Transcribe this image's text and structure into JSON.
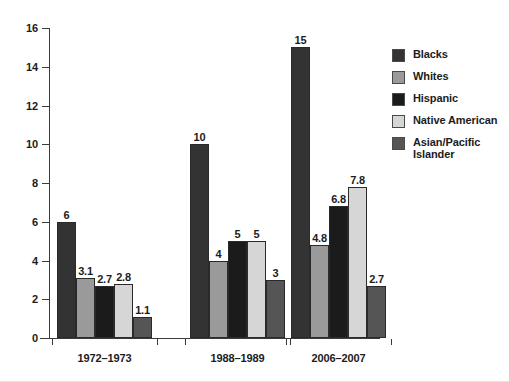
{
  "chart_data": {
    "type": "bar",
    "title": "",
    "xlabel": "",
    "ylabel": "",
    "ylim": [
      0,
      16
    ],
    "yticks": [
      0,
      2,
      4,
      6,
      8,
      10,
      12,
      14,
      16
    ],
    "ytick_labels": [
      "0",
      "2",
      "4",
      "6",
      "8",
      "10",
      "12",
      "14",
      "16"
    ],
    "grid": false,
    "legend_position": "right",
    "categories": [
      "1972–1973",
      "1988–1989",
      "2006–2007"
    ],
    "series": [
      {
        "name": "Blacks",
        "color": "#333333",
        "values": [
          6,
          10,
          15
        ],
        "labels": [
          "6",
          "10",
          "15"
        ]
      },
      {
        "name": "Whites",
        "color": "#9a9a9a",
        "values": [
          3.1,
          4,
          4.8
        ],
        "labels": [
          "3.1",
          "4",
          "4.8"
        ]
      },
      {
        "name": "Hispanic",
        "color": "#1b1b1b",
        "values": [
          2.7,
          5,
          6.8
        ],
        "labels": [
          "2.7",
          "5",
          "6.8"
        ]
      },
      {
        "name": "Native American",
        "color": "#d6d6d6",
        "values": [
          2.8,
          5,
          7.8
        ],
        "labels": [
          "2.8",
          "5",
          "7.8"
        ]
      },
      {
        "name": "Asian/Pacific Islander",
        "color": "#555555",
        "values": [
          1.1,
          3,
          2.7
        ],
        "labels": [
          "1.1",
          "3",
          "2.7"
        ]
      }
    ]
  },
  "legend": {
    "items": [
      {
        "label": "Blacks",
        "color": "#333333"
      },
      {
        "label": "Whites",
        "color": "#9a9a9a"
      },
      {
        "label": "Hispanic",
        "color": "#1b1b1b"
      },
      {
        "label": "Native American",
        "color": "#d6d6d6"
      },
      {
        "label": "Asian/Pacific Islander",
        "color": "#555555"
      }
    ]
  }
}
